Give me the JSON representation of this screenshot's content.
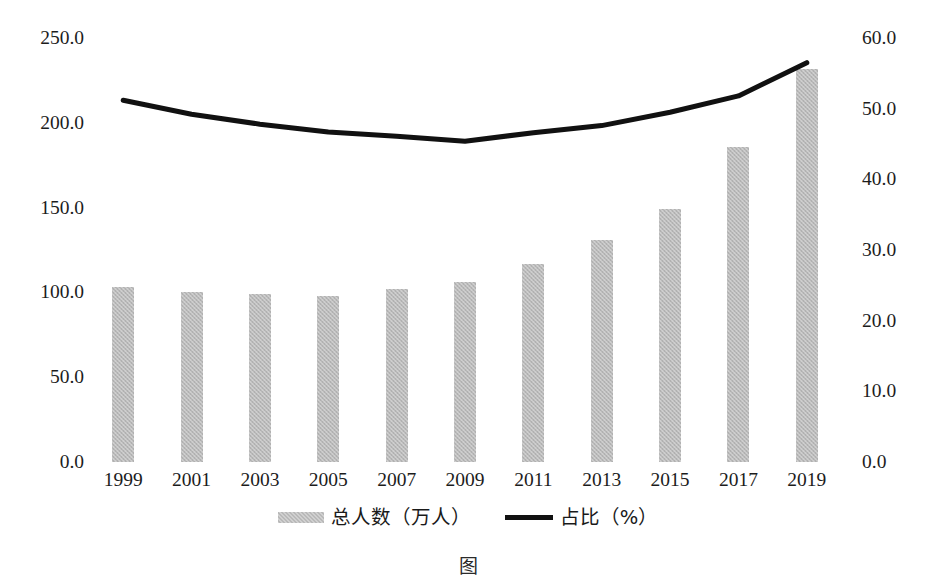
{
  "chart_data": {
    "type": "bar",
    "title": "",
    "subtitle": "",
    "xlabel": "",
    "categories": [
      "1999",
      "2001",
      "2003",
      "2005",
      "2007",
      "2009",
      "2011",
      "2013",
      "2015",
      "2017",
      "2019"
    ],
    "grid": false,
    "legend_position": "bottom-center",
    "series": [
      {
        "name": "总人数（万人）",
        "type": "bar",
        "axis": "left",
        "color": "#b9b9b9",
        "values": [
          103.0,
          100.0,
          99.0,
          98.0,
          102.0,
          106.0,
          117.0,
          131.0,
          149.0,
          186.0,
          232.0
        ]
      },
      {
        "name": "占比（%）",
        "type": "line",
        "axis": "right",
        "color": "#111111",
        "values": [
          51.2,
          49.2,
          47.8,
          46.7,
          46.1,
          45.4,
          46.6,
          47.6,
          49.5,
          51.8,
          56.5
        ]
      }
    ],
    "left_axis": {
      "ylabel": "",
      "ylim": [
        0.0,
        250.0
      ],
      "ticks": [
        "250.0",
        "200.0",
        "150.0",
        "100.0",
        "50.0",
        "0.0"
      ],
      "tick_values": [
        250.0,
        200.0,
        150.0,
        100.0,
        50.0,
        0.0
      ]
    },
    "right_axis": {
      "ylabel": "",
      "ylim": [
        0.0,
        60.0
      ],
      "ticks": [
        "60.0",
        "50.0",
        "40.0",
        "30.0",
        "20.0",
        "10.0",
        "0.0"
      ],
      "tick_values": [
        60.0,
        50.0,
        40.0,
        30.0,
        20.0,
        10.0,
        0.0
      ]
    }
  },
  "legend": {
    "items": [
      {
        "label": "总人数（万人）",
        "marker": "bar-swatch",
        "color": "#b9b9b9"
      },
      {
        "label": "占比（%）",
        "marker": "line-swatch",
        "color": "#111111"
      }
    ]
  },
  "caption": {
    "text": "图"
  }
}
